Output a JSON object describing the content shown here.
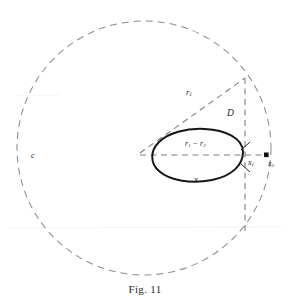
{
  "figure": {
    "caption": "Fig. 11",
    "colors": {
      "dashed_stroke": "#8c8c8c",
      "blob_stroke": "#151515",
      "marker_fill": "#111111",
      "background": "#ffffff",
      "label_color": "#1a1a1a"
    },
    "circle": {
      "center_x": 144,
      "center_y": 148,
      "radius": 127,
      "style": "dashed"
    },
    "vertex": {
      "label": "c",
      "x": 38,
      "y": 155
    },
    "labels": {
      "radius_long": "r",
      "radius_long_sub": "1",
      "offset_distance": "D",
      "radius_difference_first": "r",
      "radius_difference_first_sub": "1",
      "radius_difference_minus": " − ",
      "radius_difference_second": "r",
      "radius_difference_second_sub": "2",
      "blob_region": "x",
      "tangent_point": "x",
      "tangent_point_sub": "1",
      "exterior_point": "x",
      "exterior_point_sub": "2"
    },
    "elements": {
      "blob_name": "closed-convex-region",
      "marker_name": "point-marker",
      "vertical_line_name": "vertical-dashed-line",
      "diagonal_line_name": "radius-line",
      "horizontal_line_name": "difference-line"
    }
  }
}
